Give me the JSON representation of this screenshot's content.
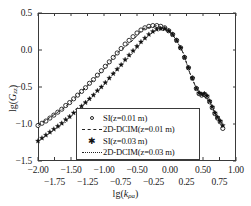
{
  "chart_data": {
    "type": "scatter",
    "title": "",
    "xlabel": "lg(kρa)",
    "ylabel": "lg(Gzz)",
    "xlim": [
      -2.0,
      1.0
    ],
    "ylim": [
      -1.5,
      0.5
    ],
    "grid": false,
    "legend_position": "lower-center",
    "x_ticks_major": [
      "-2.00",
      "-1.50",
      "-1.00",
      "-0.50",
      "0.00",
      "0.50",
      "1.00"
    ],
    "x_ticks_minor": [
      "-1.75",
      "-1.25",
      "-0.75",
      "-0.25",
      "0.25",
      "0.75"
    ],
    "x_tick_major_values": [
      -2.0,
      -1.5,
      -1.0,
      -0.5,
      0.0,
      0.5,
      1.0
    ],
    "x_tick_minor_values": [
      -1.75,
      -1.25,
      -0.75,
      -0.25,
      0.25,
      0.75
    ],
    "y_ticks": [
      "0.5",
      "0.0",
      "-0.5",
      "-1.0",
      "-1.5"
    ],
    "y_tick_values": [
      0.5,
      0.0,
      -0.5,
      -1.0,
      -1.5
    ],
    "series": [
      {
        "name": "SI(z=0.01 m)",
        "marker": "open-circle",
        "style": "markers",
        "x": [
          -2.0,
          -1.94,
          -1.88,
          -1.82,
          -1.76,
          -1.7,
          -1.64,
          -1.58,
          -1.52,
          -1.46,
          -1.4,
          -1.34,
          -1.28,
          -1.22,
          -1.16,
          -1.1,
          -1.04,
          -0.98,
          -0.92,
          -0.86,
          -0.8,
          -0.74,
          -0.68,
          -0.62,
          -0.56,
          -0.5,
          -0.44,
          -0.38,
          -0.32,
          -0.26,
          -0.2,
          -0.14,
          -0.08,
          -0.02,
          0.04,
          0.1,
          0.16,
          0.22,
          0.28,
          0.34,
          0.4,
          0.44,
          0.48,
          0.52,
          0.56,
          0.6,
          0.64,
          0.68,
          0.72,
          0.76,
          0.8
        ],
        "y": [
          -1.02,
          -0.99,
          -0.96,
          -0.92,
          -0.88,
          -0.84,
          -0.8,
          -0.75,
          -0.71,
          -0.66,
          -0.61,
          -0.56,
          -0.51,
          -0.45,
          -0.4,
          -0.34,
          -0.28,
          -0.22,
          -0.16,
          -0.1,
          -0.04,
          0.02,
          0.08,
          0.13,
          0.18,
          0.23,
          0.27,
          0.3,
          0.32,
          0.33,
          0.33,
          0.32,
          0.3,
          0.26,
          0.21,
          0.13,
          0.03,
          -0.1,
          -0.24,
          -0.38,
          -0.52,
          -0.59,
          -0.61,
          -0.6,
          -0.63,
          -0.7,
          -0.78,
          -0.86,
          -0.92,
          -0.97,
          -1.06
        ]
      },
      {
        "name": "2D-DCIM(z=0.01 m)",
        "marker": "dashed-line",
        "style": "line",
        "x": [
          -2.0,
          -1.8,
          -1.6,
          -1.4,
          -1.2,
          -1.0,
          -0.8,
          -0.6,
          -0.4,
          -0.2,
          0.0,
          0.1,
          0.2,
          0.3,
          0.4,
          0.5,
          0.6,
          0.7,
          0.8
        ],
        "y": [
          -1.02,
          -0.9,
          -0.78,
          -0.61,
          -0.44,
          -0.26,
          -0.04,
          0.1,
          0.29,
          0.33,
          0.25,
          0.13,
          -0.04,
          -0.31,
          -0.52,
          -0.61,
          -0.7,
          -0.89,
          -1.06
        ]
      },
      {
        "name": "SI(z=0.03 m)",
        "marker": "filled-star",
        "style": "markers",
        "x": [
          -2.0,
          -1.94,
          -1.88,
          -1.82,
          -1.76,
          -1.7,
          -1.64,
          -1.58,
          -1.52,
          -1.46,
          -1.4,
          -1.34,
          -1.28,
          -1.22,
          -1.16,
          -1.1,
          -1.04,
          -0.98,
          -0.92,
          -0.86,
          -0.8,
          -0.74,
          -0.68,
          -0.62,
          -0.56,
          -0.5,
          -0.44,
          -0.38,
          -0.32,
          -0.26,
          -0.2,
          -0.14,
          -0.08,
          -0.02,
          0.04,
          0.1,
          0.16,
          0.22,
          0.28,
          0.34,
          0.4,
          0.44,
          0.48,
          0.52,
          0.56,
          0.6,
          0.64,
          0.68,
          0.72,
          0.76,
          0.8
        ],
        "y": [
          -1.23,
          -1.19,
          -1.15,
          -1.11,
          -1.07,
          -1.03,
          -0.99,
          -0.94,
          -0.9,
          -0.85,
          -0.81,
          -0.76,
          -0.71,
          -0.66,
          -0.61,
          -0.55,
          -0.5,
          -0.44,
          -0.38,
          -0.32,
          -0.26,
          -0.2,
          -0.13,
          -0.07,
          -0.01,
          0.05,
          0.11,
          0.16,
          0.21,
          0.25,
          0.28,
          0.29,
          0.29,
          0.26,
          0.21,
          0.13,
          0.03,
          -0.1,
          -0.24,
          -0.38,
          -0.52,
          -0.58,
          -0.6,
          -0.59,
          -0.62,
          -0.69,
          -0.77,
          -0.85,
          -0.91,
          -0.96,
          -1.02
        ]
      },
      {
        "name": "2D-DCIM(z=0.03 m)",
        "marker": "dotted-line",
        "style": "line",
        "x": [
          -2.0,
          -1.8,
          -1.6,
          -1.4,
          -1.2,
          -1.0,
          -0.8,
          -0.6,
          -0.4,
          -0.2,
          0.0,
          0.1,
          0.2,
          0.3,
          0.4,
          0.5,
          0.6,
          0.7,
          0.8
        ],
        "y": [
          -1.23,
          -1.11,
          -0.99,
          -0.81,
          -0.64,
          -0.47,
          -0.26,
          -0.08,
          0.14,
          0.28,
          0.25,
          0.13,
          -0.04,
          -0.31,
          -0.52,
          -0.6,
          -0.69,
          -0.88,
          -1.02
        ]
      }
    ]
  },
  "legend": {
    "items": [
      {
        "label": "SI(z=0.01 m)",
        "key": "open-circle"
      },
      {
        "label": "2D-DCIM(z=0.01 m)",
        "key": "dashed-line"
      },
      {
        "label": "SI(z=0.03 m)",
        "key": "filled-star"
      },
      {
        "label": "2D-DCIM(z=0.03 m)",
        "key": "dotted-line"
      }
    ]
  },
  "colors": {
    "axis": "#3a3a3a",
    "text": "#1a1a1a",
    "marker": "#111111",
    "background": "#ffffff"
  }
}
